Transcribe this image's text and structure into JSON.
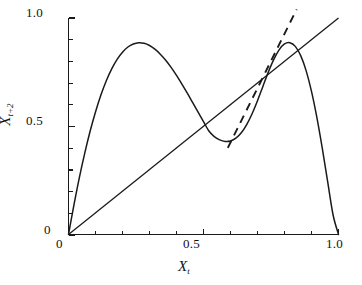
{
  "figure": {
    "kind": "line-plot",
    "background_color": "#ffffff",
    "line_color": "#1a1a1a"
  },
  "axes": {
    "x": {
      "title_base": "X",
      "title_sub": "t",
      "ticks_major": [
        "0",
        "0.5",
        "1.0"
      ],
      "tick_values": [
        0,
        0.5,
        1.0
      ],
      "minor_ticks_per_interval": 5,
      "range": [
        0,
        1
      ]
    },
    "y": {
      "title_base": "X",
      "title_sub": "t+2",
      "ticks_major": [
        "0",
        "0.5",
        "1.0"
      ],
      "tick_values": [
        0,
        0.5,
        1.0
      ],
      "minor_ticks_per_interval": 5,
      "range": [
        0,
        1
      ]
    }
  },
  "ticks": {
    "x0": "0",
    "x05": "0.5",
    "x10": "1.0",
    "y0": "0",
    "y05": "0.5",
    "y10": "1.0"
  },
  "chart_data": {
    "type": "line",
    "title": "",
    "subtitle": "",
    "xlabel": "X_t",
    "ylabel": "X_{t+2}",
    "xlim": [
      0,
      1
    ],
    "ylim": [
      0,
      1
    ],
    "xticks": [
      0,
      0.5,
      1.0
    ],
    "xticklabels": [
      "0",
      "0.5",
      "1.0"
    ],
    "yticks": [
      0,
      0.5,
      1.0
    ],
    "yticklabels": [
      "0",
      "0.5",
      "1.0"
    ],
    "grid": false,
    "legend": null,
    "annotations": [],
    "series": [
      {
        "name": "second-iterate map",
        "style": "solid",
        "color": "#1a1a1a",
        "description": "Two-humped second iterate of the logistic map; rises from origin to a first maximum near (0.18, 0.86), falls to a local minimum near (0.50, 0.42), rises through the diagonal to a second maximum near (0.82, 0.86), then falls steeply to (1.0, 0)",
        "x": [
          0.0,
          0.02,
          0.04,
          0.06,
          0.08,
          0.1,
          0.12,
          0.14,
          0.16,
          0.18,
          0.2,
          0.22,
          0.24,
          0.26,
          0.28,
          0.3,
          0.32,
          0.34,
          0.36,
          0.38,
          0.4,
          0.42,
          0.44,
          0.46,
          0.48,
          0.5,
          0.52,
          0.54,
          0.56,
          0.58,
          0.6,
          0.62,
          0.64,
          0.66,
          0.68,
          0.7,
          0.72,
          0.74,
          0.76,
          0.78,
          0.8,
          0.82,
          0.84,
          0.86,
          0.88,
          0.9,
          0.92,
          0.94,
          0.96,
          0.98,
          1.0
        ],
        "y": [
          0.0,
          0.136,
          0.262,
          0.375,
          0.477,
          0.566,
          0.644,
          0.71,
          0.765,
          0.809,
          0.842,
          0.866,
          0.88,
          0.886,
          0.883,
          0.873,
          0.856,
          0.833,
          0.805,
          0.772,
          0.735,
          0.695,
          0.653,
          0.609,
          0.565,
          0.521,
          0.478,
          0.452,
          0.437,
          0.43,
          0.432,
          0.445,
          0.47,
          0.508,
          0.558,
          0.618,
          0.684,
          0.75,
          0.808,
          0.853,
          0.88,
          0.886,
          0.869,
          0.826,
          0.757,
          0.661,
          0.54,
          0.398,
          0.243,
          0.09,
          0.0
        ]
      },
      {
        "name": "identity line",
        "style": "solid",
        "color": "#1a1a1a",
        "description": "45-degree diagonal y = x",
        "x": [
          0.0,
          1.0
        ],
        "y": [
          0.0,
          1.0
        ]
      },
      {
        "name": "tangent line at unstable fixed point",
        "style": "dashed",
        "color": "#1a1a1a",
        "description": "Steep dashed tangent to the second-iterate curve at the fixed point near (0.715, 0.715)",
        "x": [
          0.59,
          0.845
        ],
        "y": [
          0.4,
          1.04
        ]
      }
    ],
    "fixed_points": [
      {
        "x": 0.715,
        "y": 0.715,
        "note": "unstable fixed point where curve, diagonal and dashed tangent meet"
      }
    ],
    "maxima": [
      {
        "x": 0.18,
        "y": 0.86
      },
      {
        "x": 0.82,
        "y": 0.86
      }
    ],
    "minima": [
      {
        "x": 0.5,
        "y": 0.42
      }
    ]
  }
}
